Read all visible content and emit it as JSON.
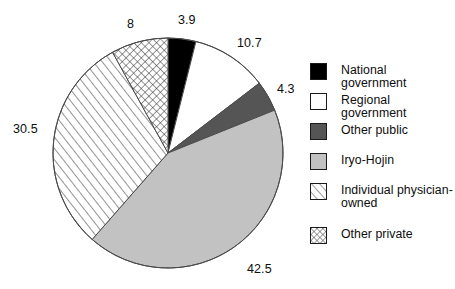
{
  "chart_data": {
    "type": "pie",
    "title": "",
    "subtitle": "",
    "xlabel": "",
    "ylabel": "",
    "grid": false,
    "legend_position": "right",
    "units": "percent",
    "start_angle_deg": 0,
    "direction": "clockwise",
    "total": 99.9,
    "categories": [
      "National government",
      "Regional government",
      "Other public",
      "Iryo-Hojin",
      "Individual physician-owned",
      "Other private"
    ],
    "values": [
      3.9,
      10.7,
      4.3,
      42.5,
      30.5,
      8
    ],
    "labels": [
      "3.9",
      "10.7",
      "4.3",
      "42.5",
      "30.5",
      "8"
    ],
    "slices": [
      {
        "label": "National government",
        "value": 3.9,
        "value_text": "3.9",
        "fill": "#000000",
        "pattern": "solid",
        "label_x": 178,
        "label_y": 13
      },
      {
        "label": "Regional government",
        "value": 10.7,
        "value_text": "10.7",
        "fill": "#ffffff",
        "pattern": "solid",
        "label_x": 237,
        "label_y": 36
      },
      {
        "label": "Other public",
        "value": 4.3,
        "value_text": "4.3",
        "fill": "#555555",
        "pattern": "solid",
        "label_x": 277,
        "label_y": 82
      },
      {
        "label": "Iryo-Hojin",
        "value": 42.5,
        "value_text": "42.5",
        "fill": "#c2c2c2",
        "pattern": "solid",
        "label_x": 247,
        "label_y": 262
      },
      {
        "label": "Individual physician-owned",
        "value": 30.5,
        "value_text": "30.5",
        "fill": "#ffffff",
        "pattern": "diagonal-hatch",
        "label_x": 13,
        "label_y": 122
      },
      {
        "label": "Other private",
        "value": 8,
        "value_text": "8",
        "fill": "#ffffff",
        "pattern": "cross-hatch",
        "label_x": 127,
        "label_y": 17
      }
    ]
  },
  "legend": {
    "items": [
      {
        "label": "National government",
        "swatch": "solid-black",
        "color": "#000000"
      },
      {
        "label": "Regional government",
        "swatch": "solid-white",
        "color": "#ffffff"
      },
      {
        "label": "Other public",
        "swatch": "solid-dark-gray",
        "color": "#555555"
      },
      {
        "label": "Iryo-Hojin",
        "swatch": "solid-light-gray",
        "color": "#c2c2c2"
      },
      {
        "label": "Individual physician-owned",
        "swatch": "diagonal-hatch",
        "color": "#ffffff"
      },
      {
        "label": "Other private",
        "swatch": "cross-hatch",
        "color": "#ffffff"
      }
    ]
  },
  "geometry": {
    "center_x": 168,
    "center_y": 153,
    "radius": 115
  }
}
